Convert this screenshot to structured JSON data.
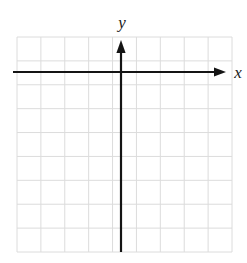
{
  "figure": {
    "kind": "coordinate-grid",
    "background_color": "#ffffff"
  },
  "grid": {
    "columns": 9,
    "rows": 9,
    "cell_size_px": 23.9,
    "left_px": 17,
    "top_px": 37,
    "right_px": 232,
    "bottom_px": 252,
    "line_color": "#dcdcdc",
    "line_width_px": 1
  },
  "axes": {
    "color": "#141414",
    "line_width_px": 2.2,
    "x_axis": {
      "label": "x",
      "label_x_px": 238,
      "label_y_px": 78,
      "y_position_px": 72,
      "start_x_px": 13,
      "end_x_px": 226,
      "arrow": "right-arrowhead",
      "arrow_tip_x_px": 226
    },
    "y_axis": {
      "label": "y",
      "label_x_px": 122,
      "label_y_px": 28,
      "x_position_px": 121,
      "start_y_px": 252,
      "end_y_px": 40,
      "arrow": "up-arrowhead",
      "arrow_tip_y_px": 40
    },
    "origin": {
      "x_px": 121,
      "y_px": 72
    }
  },
  "chart_data": {
    "type": "scatter",
    "title": "",
    "xlabel": "x",
    "ylabel": "y",
    "x": [],
    "y": [],
    "series": [],
    "xlim": [
      -5,
      4
    ],
    "ylim": [
      -7,
      2
    ],
    "grid": true,
    "legend": "none",
    "annotations": [],
    "xticks": [
      -5,
      -4,
      -3,
      -2,
      -1,
      0,
      1,
      2,
      3,
      4
    ],
    "yticks": [
      -7,
      -6,
      -5,
      -4,
      -3,
      -2,
      -1,
      0,
      1,
      2
    ]
  }
}
